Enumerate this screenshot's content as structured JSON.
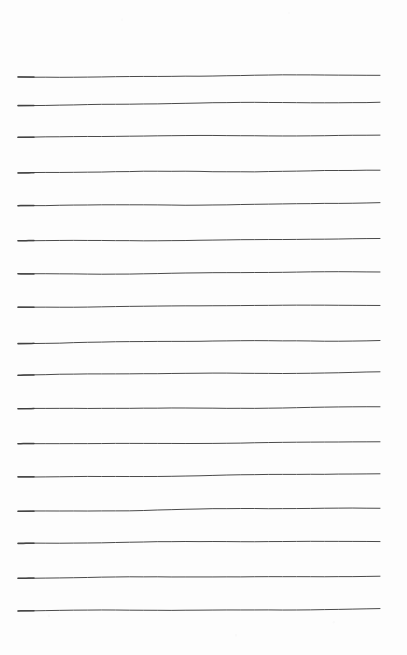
{
  "page": {
    "width": 407,
    "height": 655,
    "background_color": "#fdfdfd",
    "content_text": "",
    "notes_written": "none"
  },
  "ruling": {
    "kind": "hand-drawn-horizontal-rule",
    "line_count": 17,
    "stroke_color": "#4a4a4a",
    "stroke_width_px": 1,
    "left_margin_px": 18,
    "right_margin_px": 380,
    "top_margin_px": 76,
    "bottom_margin_px": 45,
    "average_spacing_px": 33.4,
    "lines": [
      {
        "index": 1,
        "y": 76,
        "x_start": 18,
        "x_end": 380,
        "y_start": 77,
        "y_end": 75,
        "wave": 1.0
      },
      {
        "index": 2,
        "y": 103,
        "x_start": 18,
        "x_end": 380,
        "y_start": 105,
        "y_end": 102,
        "wave": 1.2
      },
      {
        "index": 3,
        "y": 136,
        "x_start": 18,
        "x_end": 380,
        "y_start": 137,
        "y_end": 135,
        "wave": 0.9
      },
      {
        "index": 4,
        "y": 171,
        "x_start": 18,
        "x_end": 380,
        "y_start": 173,
        "y_end": 170,
        "wave": 1.3
      },
      {
        "index": 5,
        "y": 204,
        "x_start": 18,
        "x_end": 380,
        "y_start": 206,
        "y_end": 203,
        "wave": 1.1
      },
      {
        "index": 6,
        "y": 240,
        "x_start": 18,
        "x_end": 380,
        "y_start": 241,
        "y_end": 239,
        "wave": 0.8
      },
      {
        "index": 7,
        "y": 273,
        "x_start": 18,
        "x_end": 380,
        "y_start": 274,
        "y_end": 272,
        "wave": 1.0
      },
      {
        "index": 8,
        "y": 306,
        "x_start": 18,
        "x_end": 380,
        "y_start": 307,
        "y_end": 305,
        "wave": 0.7
      },
      {
        "index": 9,
        "y": 341,
        "x_start": 18,
        "x_end": 380,
        "y_start": 343,
        "y_end": 340,
        "wave": 1.2
      },
      {
        "index": 10,
        "y": 373,
        "x_start": 18,
        "x_end": 380,
        "y_start": 375,
        "y_end": 372,
        "wave": 1.1
      },
      {
        "index": 11,
        "y": 408,
        "x_start": 18,
        "x_end": 380,
        "y_start": 409,
        "y_end": 407,
        "wave": 0.9
      },
      {
        "index": 12,
        "y": 443,
        "x_start": 18,
        "x_end": 380,
        "y_start": 444,
        "y_end": 442,
        "wave": 0.8
      },
      {
        "index": 13,
        "y": 475,
        "x_start": 18,
        "x_end": 380,
        "y_start": 477,
        "y_end": 474,
        "wave": 1.0
      },
      {
        "index": 14,
        "y": 509,
        "x_start": 18,
        "x_end": 380,
        "y_start": 511,
        "y_end": 508,
        "wave": 1.3
      },
      {
        "index": 15,
        "y": 542,
        "x_start": 18,
        "x_end": 380,
        "y_start": 543,
        "y_end": 541,
        "wave": 0.9
      },
      {
        "index": 16,
        "y": 577,
        "x_start": 18,
        "x_end": 380,
        "y_start": 578,
        "y_end": 576,
        "wave": 0.8
      },
      {
        "index": 17,
        "y": 610,
        "x_start": 18,
        "x_end": 380,
        "y_start": 611,
        "y_end": 609,
        "wave": 0.9
      }
    ]
  }
}
